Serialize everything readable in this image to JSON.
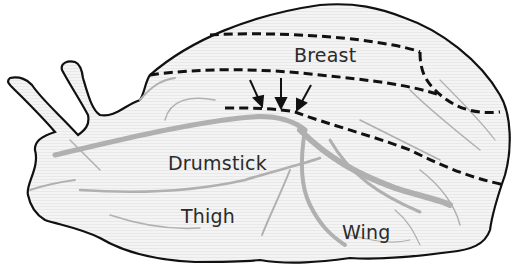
{
  "diagram": {
    "colors": {
      "outline": "#111111",
      "fill": "#f2f2f2",
      "texture": "#b5b5b5",
      "boundary_dash": "#111111",
      "text": "#2b2b2b"
    },
    "labels": {
      "breast": "Breast",
      "drumstick": "Drumstick",
      "thigh": "Thigh",
      "wing": "Wing"
    },
    "annotations": {
      "arrows_count": 3,
      "arrows_target": "boundary line between breast and drumstick regions"
    }
  }
}
